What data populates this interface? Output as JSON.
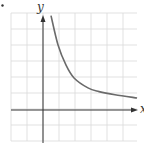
{
  "bullet": "•",
  "chart_data": {
    "type": "line",
    "title": "",
    "xlabel": "x",
    "ylabel": "y",
    "grid": true,
    "xlim": [
      -2,
      5.9
    ],
    "ylim": [
      -2,
      6
    ],
    "grid_spacing": 1,
    "series": [
      {
        "name": "curve",
        "description": "decreasing curve approaching x-axis, vertical asymptote at x=0 (y ≈ 4/x)",
        "x": [
          0.5,
          0.94,
          1.44,
          1.94,
          2.81,
          3.5,
          4.5,
          5.88
        ],
        "y": [
          5.9,
          4.06,
          2.8,
          2.0,
          1.38,
          1.15,
          0.95,
          0.75
        ]
      }
    ]
  },
  "colors": {
    "grid": "#d9d9d9",
    "axis": "#333333",
    "curve": "#6a6a6a"
  }
}
